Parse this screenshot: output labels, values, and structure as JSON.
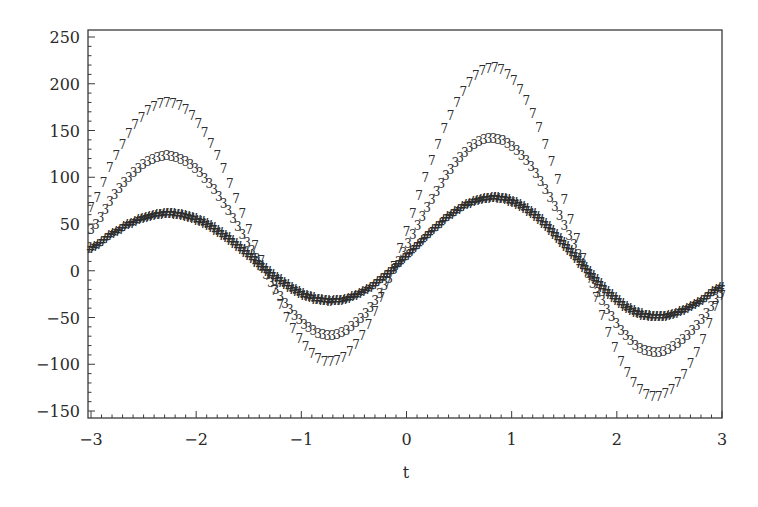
{
  "chart_data": {
    "type": "scatter",
    "title": "",
    "xlabel": "t",
    "ylabel": "",
    "xlim": [
      -3,
      3
    ],
    "ylim": [
      -150,
      250
    ],
    "grid": false,
    "legend": null,
    "x_ticks": [
      -3,
      -2,
      -1,
      0,
      1,
      2,
      3
    ],
    "x_tick_labels": [
      "−3",
      "−2",
      "−1",
      "0",
      "1",
      "2",
      "3"
    ],
    "y_ticks": [
      250,
      200,
      150,
      100,
      50,
      0,
      -50,
      -100,
      -150
    ],
    "y_tick_labels": [
      "250",
      "200",
      "150",
      "100",
      "50",
      "0",
      "−50",
      "−100",
      "−150"
    ],
    "x": [
      -3.0,
      -2.8,
      -2.6,
      -2.4,
      -2.2,
      -2.0,
      -1.8,
      -1.6,
      -1.4,
      -1.2,
      -1.0,
      -0.8,
      -0.6,
      -0.4,
      -0.2,
      0.0,
      0.2,
      0.4,
      0.6,
      0.8,
      1.0,
      1.2,
      1.4,
      1.6,
      1.8,
      2.0,
      2.2,
      2.4,
      2.6,
      2.8,
      3.0
    ],
    "series": [
      {
        "name": "upper",
        "marker": "7",
        "values": [
          66.9,
          114,
          152.5,
          175.4,
          178.1,
          159.9,
          122.6,
          71.9,
          15.9,
          -36.6,
          -76.4,
          -96.5,
          -93.1,
          -65.8,
          -18.5,
          41.7,
          105.2,
          161.3,
          200.9,
          216.6,
          205.3,
          167.9,
          110,
          40.5,
          -29.3,
          -87.9,
          -125.3,
          -134.7,
          -117.2,
          -78.6,
          -27.1
        ]
      },
      {
        "name": "middle",
        "marker": "3",
        "values": [
          43.2,
          76.8,
          103.9,
          119.6,
          121.1,
          107.8,
          81.5,
          46.2,
          7.5,
          -28.4,
          -55.3,
          -68.6,
          -65.8,
          -47.1,
          -15,
          25.4,
          67.7,
          104.9,
          130.8,
          140.8,
          133,
          108.2,
          70.1,
          24.8,
          -20.4,
          -58.2,
          -82,
          -87.7,
          -76.8,
          -53.8,
          -24
        ]
      },
      {
        "name": "lower",
        "marker": "#",
        "values": [
          23.4,
          38.6,
          51.2,
          58.9,
          60.1,
          54.3,
          42.2,
          25.3,
          6.5,
          -11.4,
          -25.2,
          -32.3,
          -31.4,
          -22.2,
          -5.9,
          15.1,
          37.4,
          57.4,
          71.6,
          77.4,
          73.6,
          60.4,
          39.6,
          14.6,
          -10.8,
          -32.3,
          -46.1,
          -49.8,
          -44.4,
          -32.6,
          -17.4
        ]
      }
    ]
  },
  "colors": {
    "axis": "#3a3a3a",
    "marker": "#2e2e2e",
    "background": "#ffffff"
  }
}
